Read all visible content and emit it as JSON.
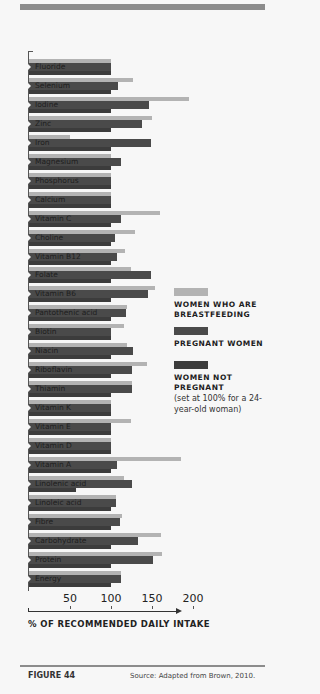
{
  "figure": {
    "label": "FIGURE 44",
    "source": "Source: Adapted from Brown, 2010."
  },
  "colors": {
    "breastfeeding": "#b3b3b3",
    "pregnant": "#4a4a4a",
    "not_pregnant": "#3c3c3c",
    "rule": "#8c8c8c"
  },
  "axis": {
    "title": "% OF RECOMMENDED DAILY INTAKE",
    "ticks": [
      "50",
      "100",
      "150",
      "200"
    ]
  },
  "legend": {
    "items": [
      {
        "title": "WOMEN WHO ARE BREASTFEEDING",
        "note": ""
      },
      {
        "title": "PREGNANT WOMEN",
        "note": ""
      },
      {
        "title": "WOMEN NOT PREGNANT",
        "note": "(set at 100% for a 24-year-old woman)"
      }
    ]
  },
  "chart_data": {
    "type": "bar",
    "orientation": "horizontal",
    "title": "",
    "xlabel": "% OF RECOMMENDED DAILY INTAKE",
    "ylabel": "",
    "xlim": [
      0,
      200
    ],
    "xticks": [
      50,
      100,
      150,
      200
    ],
    "grid": false,
    "legend_position": "right",
    "categories": [
      "Fluoride",
      "Selenium",
      "Iodine",
      "Zinc",
      "Iron",
      "Magnesium",
      "Phosphorus",
      "Calcium",
      "Vitamin C",
      "Choline",
      "Vitamin B12",
      "Folate",
      "Vitamin B6",
      "Pantothenic acid",
      "Biotin",
      "Niacin",
      "Riboflavin",
      "Thiamin",
      "Vitamin K",
      "Vitamin E",
      "Vitamin D",
      "Vitamin A",
      "Linolenic acid",
      "Linoleic acid",
      "Fibre",
      "Carbohydrate",
      "Protein",
      "Energy"
    ],
    "series": [
      {
        "name": "Women who are breastfeeding",
        "values": [
          100,
          127,
          195,
          150,
          50,
          100,
          100,
          100,
          160,
          129,
          117,
          124,
          154,
          120,
          116,
          120,
          144,
          125,
          100,
          124,
          100,
          185,
          116,
          106,
          114,
          161,
          162,
          112
        ]
      },
      {
        "name": "Pregnant women",
        "values": [
          100,
          109,
          146,
          138,
          149,
          112,
          100,
          100,
          112,
          105,
          107,
          149,
          145,
          118,
          100,
          127,
          125,
          125,
          100,
          100,
          100,
          107,
          125,
          106,
          111,
          133,
          151,
          112
        ]
      },
      {
        "name": "Women not pregnant (set at 100% for a 24-year-old woman)",
        "values": [
          100,
          100,
          100,
          100,
          100,
          100,
          100,
          100,
          100,
          100,
          100,
          100,
          100,
          100,
          100,
          100,
          100,
          100,
          100,
          100,
          100,
          100,
          57,
          100,
          100,
          100,
          100,
          100
        ]
      }
    ]
  }
}
